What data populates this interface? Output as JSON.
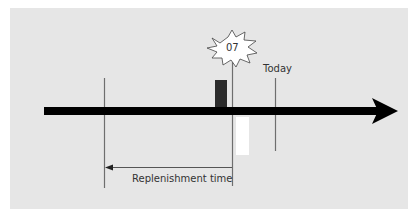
{
  "diagram": {
    "burst_label": "07",
    "today_label": "Today",
    "replenishment_label": "Replenishment time",
    "colors": {
      "background": "#e6e6e6",
      "timeline": "#000000",
      "dark_bar": "#2b2b2b",
      "light_bar": "#ffffff",
      "lines": "#6e6e6e"
    }
  }
}
